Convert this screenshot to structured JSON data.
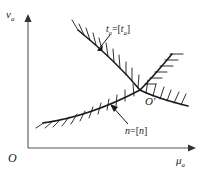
{
  "figure": {
    "kind": "engineering-constraint-diagram",
    "axes": {
      "y_label": "v",
      "y_label_sub": "a",
      "x_label": "μ",
      "x_label_sub": "a",
      "origin_label": "O",
      "x_axis_from": [
        28,
        148
      ],
      "x_axis_to": [
        190,
        148
      ],
      "y_axis_from": [
        28,
        148
      ],
      "y_axis_to": [
        28,
        16
      ]
    },
    "intersection": {
      "label": "O'",
      "x": 140,
      "y": 90
    },
    "curves": [
      {
        "id": "curve-ta",
        "label": "t",
        "label_sub": "a",
        "label_eq": "=[",
        "label_tail": "]",
        "label_text": "tₐ=[tₐ]",
        "description": "descending-convex-boundary",
        "hatch_side": "above-left",
        "path": "M 78,30 C 100,48 120,66 140,90 C 156,98 172,102 188,106"
      },
      {
        "id": "curve-n",
        "label": "n",
        "label_eq": "=[",
        "label_tail": "]",
        "label_text": "n=[n]",
        "description": "rising-concave-boundary",
        "hatch_side": "below-right",
        "path": "M 43,123 C 72,119 106,108 140,90 C 152,78 162,66 172,54"
      }
    ],
    "leaders": [
      {
        "id": "leader-ta",
        "from": [
          110,
          34
        ],
        "to": [
          97,
          50
        ]
      },
      {
        "id": "leader-n",
        "from": [
          128,
          124
        ],
        "to": [
          110,
          105
        ]
      }
    ],
    "colors": {
      "ink": "#1a1a1a",
      "axis": "#555555",
      "background": "#ffffff"
    }
  }
}
